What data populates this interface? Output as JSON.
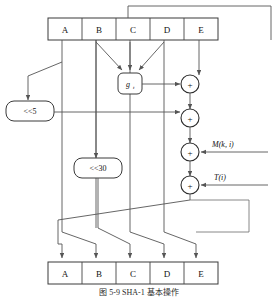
{
  "figure": {
    "caption": "图 5-9   SHA-1 基本操作"
  },
  "registers": {
    "top": {
      "name": "top-register-row",
      "cells": [
        {
          "label": "A"
        },
        {
          "label": "B"
        },
        {
          "label": "C"
        },
        {
          "label": "D"
        },
        {
          "label": "E"
        }
      ]
    },
    "bottom": {
      "name": "bottom-register-row",
      "cells": [
        {
          "label": "A"
        },
        {
          "label": "B"
        },
        {
          "label": "C"
        },
        {
          "label": "D"
        },
        {
          "label": "E"
        }
      ]
    }
  },
  "blocks": {
    "g_function": {
      "label": "g",
      "subscript": "t"
    },
    "shift_left_5": {
      "label": "<<5"
    },
    "shift_left_30": {
      "label": "<<30"
    }
  },
  "adders": [
    {
      "id": "adder-1",
      "label": "+"
    },
    {
      "id": "adder-2",
      "label": "+"
    },
    {
      "id": "adder-3",
      "label": "+"
    },
    {
      "id": "adder-4",
      "label": "+"
    }
  ],
  "inputs": [
    {
      "id": "message-word-input",
      "label": "M(k, i)"
    },
    {
      "id": "round-constant-input",
      "label": "T(i)"
    }
  ],
  "colors": {
    "background": "#ffffff",
    "wire": "#555555",
    "box_stroke": "#3a3a3a",
    "text": "#111111",
    "caption": "#2b2b2b"
  }
}
